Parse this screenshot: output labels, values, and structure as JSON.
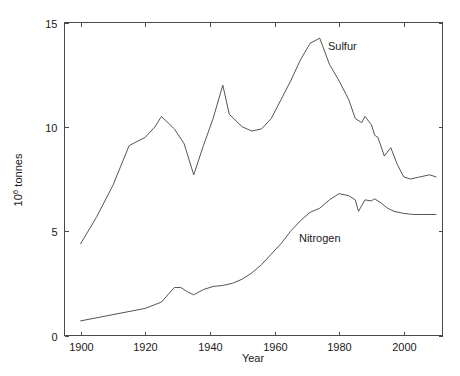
{
  "chart_data": {
    "type": "line",
    "title": "",
    "xlabel": "Year",
    "ylabel": "10^6 tonnes",
    "ylabel_mantissa": "10",
    "ylabel_exponent": "6",
    "ylabel_unit": " tonnes",
    "xlim": [
      1895,
      2012
    ],
    "ylim": [
      0,
      15
    ],
    "xticks": [
      1900,
      1920,
      1940,
      1960,
      1980,
      2000
    ],
    "xtick_labels": [
      "1900",
      "1920",
      "1940",
      "1960",
      "1980",
      "2000"
    ],
    "yticks": [
      0,
      5,
      10,
      15
    ],
    "ytick_labels": [
      "0",
      "5",
      "10",
      "15"
    ],
    "grid": false,
    "legend_position": "inline-annotation",
    "series": [
      {
        "name": "Sulfur",
        "annotation_label": "Sulfur",
        "annotation_x": 1981,
        "annotation_y": 13.7,
        "color": "#555555",
        "x": [
          1900,
          1905,
          1910,
          1915,
          1920,
          1923,
          1925,
          1929,
          1932,
          1935,
          1938,
          1941,
          1944,
          1946,
          1950,
          1953,
          1956,
          1959,
          1962,
          1965,
          1968,
          1971,
          1974,
          1977,
          1980,
          1983,
          1985,
          1987,
          1988,
          1990,
          1991,
          1992,
          1994,
          1996,
          1998,
          2000,
          2002,
          2005,
          2008,
          2010
        ],
        "y": [
          4.4,
          5.7,
          7.2,
          9.1,
          9.5,
          10.0,
          10.5,
          9.9,
          9.2,
          7.7,
          9.1,
          10.4,
          12.0,
          10.6,
          10.0,
          9.8,
          9.9,
          10.4,
          11.3,
          12.2,
          13.2,
          14.0,
          14.25,
          13.0,
          12.2,
          11.3,
          10.4,
          10.2,
          10.5,
          10.1,
          9.6,
          9.5,
          8.6,
          9.0,
          8.2,
          7.6,
          7.5,
          7.6,
          7.7,
          7.6
        ]
      },
      {
        "name": "Nitrogen",
        "annotation_label": "Nitrogen",
        "annotation_x": 1974,
        "annotation_y": 4.5,
        "color": "#555555",
        "x": [
          1900,
          1910,
          1920,
          1925,
          1929,
          1931,
          1933,
          1935,
          1938,
          1941,
          1944,
          1947,
          1950,
          1953,
          1956,
          1959,
          1962,
          1965,
          1968,
          1971,
          1974,
          1977,
          1980,
          1983,
          1985,
          1986,
          1988,
          1990,
          1991,
          1993,
          1995,
          1997,
          2000,
          2003,
          2006,
          2010
        ],
        "y": [
          0.7,
          1.0,
          1.3,
          1.6,
          2.3,
          2.3,
          2.1,
          1.95,
          2.2,
          2.35,
          2.4,
          2.5,
          2.7,
          3.0,
          3.4,
          3.9,
          4.4,
          5.0,
          5.5,
          5.9,
          6.1,
          6.5,
          6.8,
          6.7,
          6.5,
          5.95,
          6.5,
          6.45,
          6.55,
          6.35,
          6.1,
          5.95,
          5.85,
          5.8,
          5.8,
          5.8
        ]
      }
    ]
  },
  "axes": {
    "x_title": "Year"
  }
}
